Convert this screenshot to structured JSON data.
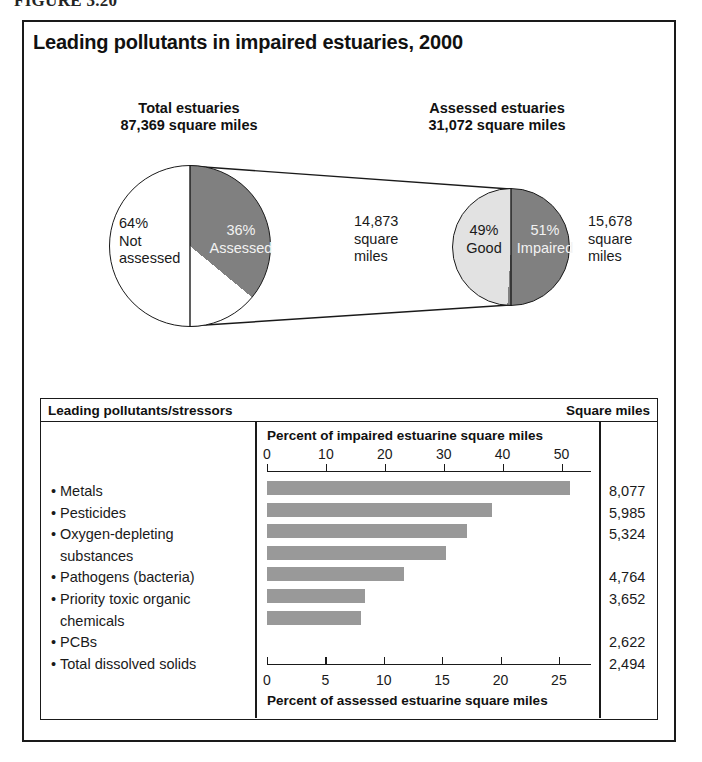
{
  "figure": {
    "caption": "FIGURE 3.20"
  },
  "chart": {
    "title": "Leading pollutants in impaired estuaries, 2000"
  },
  "pies": {
    "left": {
      "header_line1": "Total estuaries",
      "header_line2": "87,369 square miles",
      "slice_white_pct": "64%",
      "slice_white_line1": "Not",
      "slice_white_line2": "assessed",
      "slice_gray_pct": "36%",
      "slice_gray_label": "Assessed"
    },
    "right": {
      "header_line1": "Assessed estuaries",
      "header_line2": "31,072 square miles",
      "left_value_line1": "14,873",
      "left_value_line2": "square",
      "left_value_line3": "miles",
      "slice_light_pct": "49%",
      "slice_light_label": "Good",
      "slice_gray_pct": "51%",
      "slice_gray_label": "Impaired",
      "right_value_line1": "15,678",
      "right_value_line2": "square",
      "right_value_line3": "miles"
    }
  },
  "table": {
    "header_left": "Leading pollutants/stressors",
    "header_right": "Square miles",
    "axis_title_top": "Percent of impaired estuarine square miles",
    "axis_title_bottom": "Percent of assessed estuarine square miles"
  },
  "colors": {
    "bar_fill": "#999999",
    "pie_gray": "#808080",
    "pie_light": "#e2e2e2",
    "ink": "#1a1a1a"
  },
  "chart_data": {
    "type": "bar",
    "title": "Leading pollutants in impaired estuaries, 2000",
    "orientation": "horizontal",
    "categories": [
      "Metals",
      "Pesticides",
      "Oxygen-depleting substances",
      "Pathogens (bacteria)",
      "Priority toxic organic chemicals",
      "PCBs",
      "Total dissolved solids"
    ],
    "category_lines": [
      [
        "Metals"
      ],
      [
        "Pesticides"
      ],
      [
        "Oxygen-depleting",
        "substances"
      ],
      [
        "Pathogens (bacteria)"
      ],
      [
        "Priority toxic organic",
        "chemicals"
      ],
      [
        "PCBs"
      ],
      [
        "Total dissolved solids"
      ]
    ],
    "values": [
      8077,
      5985,
      5324,
      4764,
      3652,
      2622,
      2494
    ],
    "value_labels": [
      "8,077",
      "5,985",
      "5,324",
      "4,764",
      "3,652",
      "2,622",
      "2,494"
    ],
    "value_unit": "square miles",
    "percent_of_impaired": [
      51.5,
      38.2,
      34.0,
      30.4,
      23.3,
      16.7,
      15.9
    ],
    "percent_of_assessed": [
      26.0,
      19.3,
      17.1,
      15.3,
      11.8,
      8.4,
      8.0
    ],
    "xlabel_top": "Percent of impaired estuarine square miles",
    "xlabel_bottom": "Percent of assessed estuarine square miles",
    "ylabel": "Leading pollutants/stressors",
    "xticks_top": [
      0,
      10,
      20,
      30,
      40,
      50
    ],
    "xtick_labels_top": [
      "0",
      "10",
      "20",
      "30",
      "40",
      "50"
    ],
    "xlim_top": [
      0,
      55
    ],
    "xticks_bottom": [
      0,
      5,
      10,
      15,
      20,
      25
    ],
    "xtick_labels_bottom": [
      "0",
      "5",
      "10",
      "15",
      "20",
      "25"
    ],
    "xlim_bottom": [
      0,
      27.75
    ],
    "grid": false,
    "legend": "none"
  },
  "pie_data": [
    {
      "type": "pie",
      "title": "Total estuaries 87,369 square miles",
      "labels": [
        "Assessed",
        "Not assessed"
      ],
      "values": [
        36,
        64
      ],
      "value_labels": [
        "36%",
        "64%"
      ],
      "total": 87369,
      "unit": "square miles"
    },
    {
      "type": "pie",
      "title": "Assessed estuaries 31,072 square miles",
      "labels": [
        "Impaired",
        "Good"
      ],
      "values": [
        51,
        49
      ],
      "value_labels": [
        "51%",
        "49%"
      ],
      "absolute_values": [
        15678,
        14873
      ],
      "total": 31072,
      "unit": "square miles"
    }
  ]
}
